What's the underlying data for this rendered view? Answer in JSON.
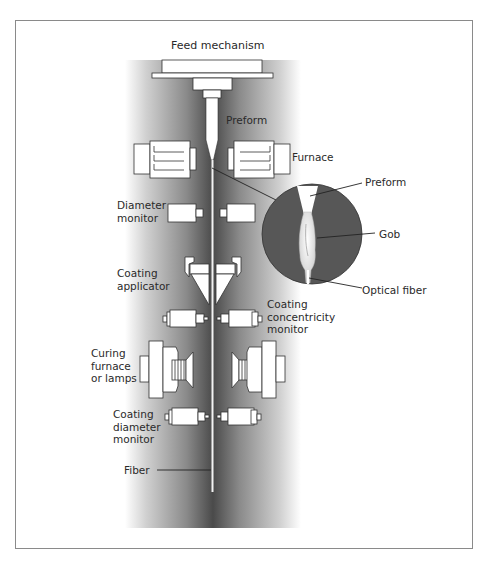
{
  "diagram": {
    "colors": {
      "frame": "#8a8a8a",
      "column_dark": "#4a4a4a",
      "column_light": "#ffffff",
      "inset_circle": "#575757",
      "component_fill": "#ffffff",
      "component_stroke": "#333333",
      "fiber": "#f2f2f2"
    },
    "labels": {
      "feed_mechanism": "Feed mechanism",
      "preform": "Preform",
      "furnace": "Furnace",
      "diameter_monitor": "Diameter\nmonitor",
      "coating_applicator": "Coating\napplicator",
      "coating_concentricity_monitor": "Coating\nconcentricity\nmonitor",
      "curing_furnace": "Curing\nfurnace\nor lamps",
      "coating_diameter_monitor": "Coating\ndiameter\nmonitor",
      "fiber": "Fiber"
    },
    "inset": {
      "preform": "Preform",
      "gob": "Gob",
      "optical_fiber": "Optical fiber"
    },
    "components_top_to_bottom": [
      "Feed mechanism",
      "Preform",
      "Furnace",
      "Diameter monitor",
      "Coating applicator",
      "Coating concentricity monitor",
      "Curing furnace or lamps",
      "Coating diameter monitor",
      "Fiber"
    ]
  }
}
